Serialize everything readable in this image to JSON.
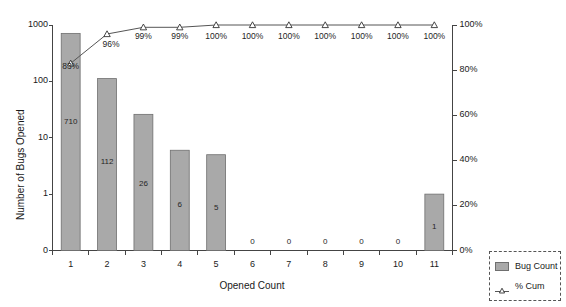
{
  "chart_data": {
    "type": "bar",
    "title": "",
    "subtitle": "",
    "xlabel": "Opened Count",
    "ylabel": "Number of Bugs Opened",
    "y2label": "",
    "categories": [
      "1",
      "2",
      "3",
      "4",
      "5",
      "6",
      "7",
      "8",
      "9",
      "10",
      "11"
    ],
    "series": [
      {
        "name": "Bug Count",
        "type": "bar",
        "axis": "left",
        "values": [
          710,
          112,
          26,
          6,
          5,
          0,
          0,
          0,
          0,
          0,
          1
        ],
        "value_labels": [
          "710",
          "112",
          "26",
          "6",
          "5",
          "0",
          "0",
          "0",
          "0",
          "0",
          "1"
        ],
        "color": "#a9a9a9"
      },
      {
        "name": "% Cum",
        "type": "line",
        "axis": "right",
        "values": [
          83,
          96,
          99,
          99,
          100,
          100,
          100,
          100,
          100,
          100,
          100
        ],
        "value_labels": [
          "83%",
          "96%",
          "99%",
          "99%",
          "100%",
          "100%",
          "100%",
          "100%",
          "100%",
          "100%",
          "100%"
        ],
        "color": "#555555",
        "marker": "triangle"
      }
    ],
    "yticks": [
      "1000",
      "100",
      "10",
      "1",
      "0"
    ],
    "ytick_values": [
      1000,
      100,
      10,
      1,
      0
    ],
    "yscale": "log",
    "ylim": [
      0,
      1000
    ],
    "y2ticks": [
      "100%",
      "80%",
      "60%",
      "40%",
      "20%",
      "0%"
    ],
    "y2tick_values": [
      100,
      80,
      60,
      40,
      20,
      0
    ],
    "y2lim": [
      0,
      100
    ],
    "xtick_labels": [
      "1",
      "2",
      "3",
      "4",
      "5",
      "6",
      "7",
      "8",
      "9",
      "10",
      "11"
    ],
    "grid": false,
    "legend_position": "bottom-right"
  },
  "legend": {
    "entries": [
      {
        "label": "Bug Count",
        "marker": "filled-square",
        "color": "#a9a9a9"
      },
      {
        "label": "% Cum",
        "marker": "line-with-triangle",
        "color": "#555555"
      }
    ]
  }
}
